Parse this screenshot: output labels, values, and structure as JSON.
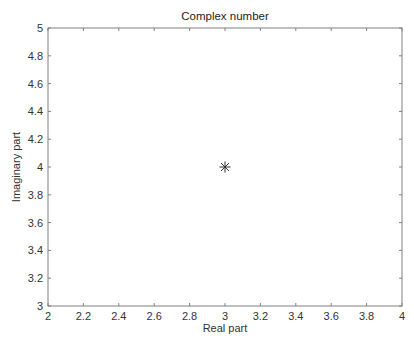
{
  "chart_data": {
    "type": "scatter",
    "title": "Complex number",
    "xlabel": "Real part",
    "ylabel": "Imaginary part",
    "xlim": [
      2,
      4
    ],
    "ylim": [
      3,
      5
    ],
    "xticks": [
      "2",
      "2.2",
      "2.4",
      "2.6",
      "2.8",
      "3",
      "3.2",
      "3.4",
      "3.6",
      "3.8",
      "4"
    ],
    "yticks": [
      "3",
      "3.2",
      "3.4",
      "3.6",
      "3.8",
      "4",
      "4.2",
      "4.4",
      "4.6",
      "4.8",
      "5"
    ],
    "grid": false,
    "legend": null,
    "series": [
      {
        "name": "z",
        "marker": "asterisk",
        "color": "#333333",
        "x": [
          3
        ],
        "y": [
          4
        ]
      }
    ]
  },
  "layout": {
    "plot_left": 48,
    "plot_top": 28,
    "plot_right": 402,
    "plot_bottom": 306,
    "axis_color": "#808080"
  }
}
